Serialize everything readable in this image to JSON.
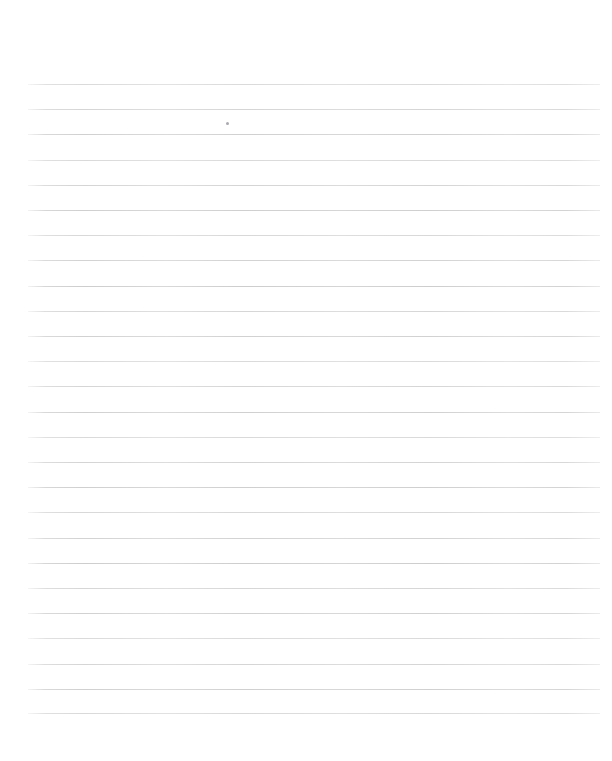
{
  "document": {
    "kind": "ruled-notebook-paper",
    "title": "",
    "page_width": 612,
    "page_height": 761,
    "background_color": "#ffffff",
    "text_content": "",
    "header_text": "",
    "footer_text": "",
    "page_number": ""
  },
  "ruling": {
    "line_color": "#cdcdcd",
    "line_thickness_px": 1,
    "line_start_x": 28,
    "line_end_x": 600,
    "line_length_px": 572,
    "first_line_y": 84,
    "last_line_y": 713,
    "line_spacing_px": 25.2,
    "line_count": 26,
    "margin_rule_present": false,
    "margin_rule_color": "",
    "top_margin_px": 84,
    "bottom_margin_px": 48,
    "left_margin_px": 28,
    "right_margin_px": 12,
    "line_ys": [
      84,
      109.2,
      134.4,
      159.6,
      184.8,
      210,
      235.2,
      260.4,
      285.6,
      310.8,
      336,
      361.2,
      386.4,
      411.6,
      436.8,
      462,
      487.2,
      512.4,
      537.6,
      562.8,
      588,
      613.2,
      638.4,
      663.6,
      688.8,
      713
    ]
  },
  "marks": [
    {
      "name": "stray-speck",
      "x": 226,
      "y": 122,
      "size": 3,
      "color": "#aaaaaf",
      "label": ""
    }
  ]
}
